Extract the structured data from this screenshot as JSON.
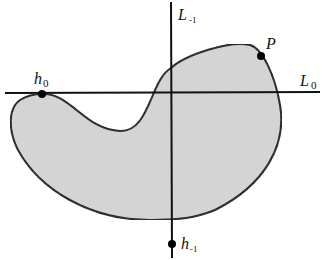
{
  "figure": {
    "region": {
      "fill": "#d6d6d6",
      "stroke": "#111111",
      "description": "shaded kidney-shaped region"
    },
    "axes": {
      "horizontal_line": {
        "label": "L",
        "subscript": "0"
      },
      "vertical_line": {
        "label": "L",
        "subscript": "-1"
      }
    },
    "points": [
      {
        "id": "h0",
        "label": "h",
        "subscript": "0"
      },
      {
        "id": "P",
        "label": "P",
        "subscript": ""
      },
      {
        "id": "h-1",
        "label": "h",
        "subscript": "-1"
      }
    ]
  }
}
